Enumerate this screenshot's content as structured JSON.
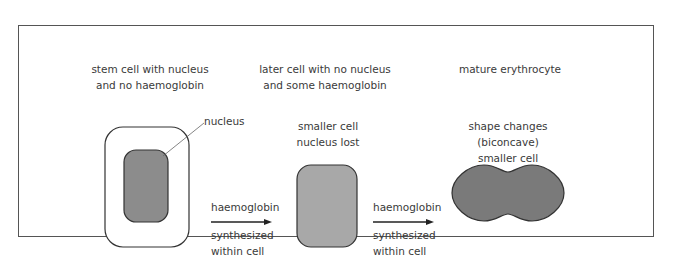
{
  "diagram": {
    "stages": [
      {
        "heading": [
          "stem cell with nucleus",
          "and no haemoglobin"
        ],
        "callout": "nucleus",
        "fill": "#8c8c8c"
      },
      {
        "heading": [
          "later cell with no nucleus",
          "and some haemoglobin"
        ],
        "description": [
          "smaller cell",
          "nucleus lost"
        ],
        "fill": "#a8a8a8"
      },
      {
        "heading": [
          "mature erythrocyte"
        ],
        "description": [
          "shape changes",
          "(biconcave)",
          "smaller cell"
        ],
        "fill": "#7a7a7a"
      }
    ],
    "transitions": [
      {
        "above": "haemoglobin",
        "below": [
          "synthesized",
          "within cell"
        ]
      },
      {
        "above": "haemoglobin",
        "below": [
          "synthesized",
          "within cell"
        ]
      }
    ],
    "colors": {
      "frame": "#555555",
      "outline": "#333333",
      "text": "#3a3a3a"
    }
  }
}
